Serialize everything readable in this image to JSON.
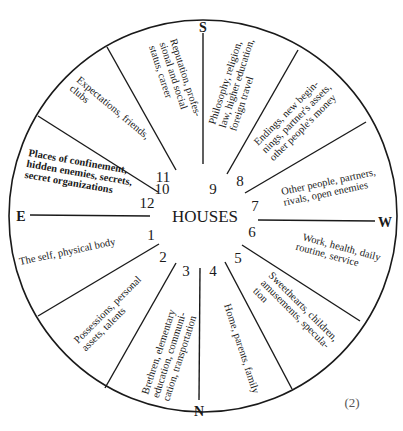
{
  "diagram": {
    "title": "HOUSES",
    "figure_number": "(2)",
    "directions": {
      "south": "S",
      "north": "N",
      "east": "E",
      "west": "W"
    },
    "houses": [
      {
        "number": "1",
        "lines": [
          "The self, physical body"
        ]
      },
      {
        "number": "2",
        "lines": [
          "Possessions, personal",
          "assets, talents"
        ]
      },
      {
        "number": "3",
        "lines": [
          "Brethren, elementary",
          "education, communi-",
          "cation, transportation"
        ]
      },
      {
        "number": "4",
        "lines": [
          "Home, parents, family"
        ]
      },
      {
        "number": "5",
        "lines": [
          "Sweethearts, children,",
          "amusements, specula-",
          "tion"
        ]
      },
      {
        "number": "6",
        "lines": [
          "Work, health, daily",
          "routine, service"
        ]
      },
      {
        "number": "7",
        "lines": [
          "Other people, partners,",
          "rivals, open enemies"
        ]
      },
      {
        "number": "8",
        "lines": [
          "Endings, new begin-",
          "nings, partner's assets,",
          "other people's money"
        ]
      },
      {
        "number": "9",
        "lines": [
          "Philosophy, religion,",
          "law, higher education,",
          "foreign travel"
        ]
      },
      {
        "number": "10",
        "lines": [
          "Reputation, profes-",
          "sional and social",
          "status, career"
        ]
      },
      {
        "number": "11",
        "lines": [
          "Expectations, friends,",
          "clubs"
        ]
      },
      {
        "number": "12",
        "lines": [
          "Places of confinement,",
          "hidden enemies, secrets,",
          "secret organizations"
        ]
      }
    ]
  }
}
